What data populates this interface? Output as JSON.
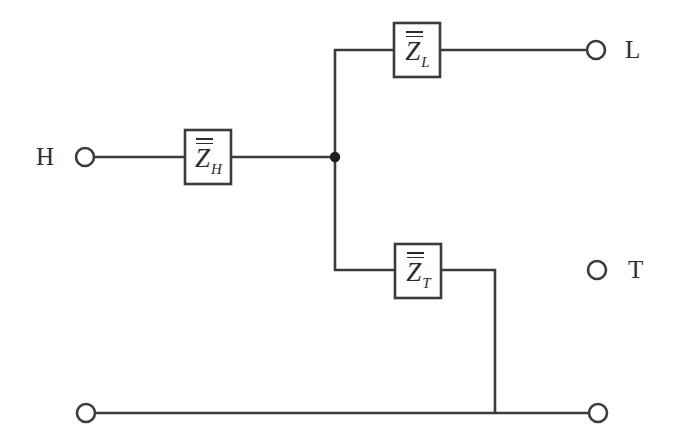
{
  "diagram": {
    "type": "circuit-schematic",
    "background_color": "#ffffff",
    "line_color": "#3b3b3b",
    "text_color": "#2b2b2b"
  },
  "ports": [
    {
      "id": "H",
      "label": "H",
      "label_x": 36,
      "label_y": 144,
      "circle_x": 85,
      "circle_y": 157,
      "radius": 9
    },
    {
      "id": "L",
      "label": "L",
      "label_x": 625,
      "label_y": 37,
      "circle_x": 596,
      "circle_y": 50,
      "radius": 9
    },
    {
      "id": "T",
      "label": "T",
      "label_x": 628,
      "label_y": 257,
      "circle_x": 597,
      "circle_y": 270,
      "radius": 9
    },
    {
      "id": "GND_LEFT",
      "label": "",
      "circle_x": 86,
      "circle_y": 413,
      "radius": 9
    },
    {
      "id": "GND_RIGHT",
      "label": "",
      "circle_x": 598,
      "circle_y": 413,
      "radius": 9
    }
  ],
  "elements": [
    {
      "id": "ZL",
      "symbol": "Z",
      "subscript": "L",
      "overbars": 2,
      "box": {
        "x": 394,
        "y": 23,
        "w": 46,
        "h": 54
      },
      "label_x": 394,
      "label_y": 31
    },
    {
      "id": "ZH",
      "symbol": "Z",
      "subscript": "H",
      "overbars": 2,
      "box": {
        "x": 185,
        "y": 130,
        "w": 46,
        "h": 54
      },
      "label_x": 185,
      "label_y": 138
    },
    {
      "id": "ZT",
      "symbol": "Z",
      "subscript": "T",
      "overbars": 2,
      "box": {
        "x": 395,
        "y": 244,
        "w": 46,
        "h": 54
      },
      "label_x": 395,
      "label_y": 252
    }
  ],
  "junction": {
    "x": 335,
    "y": 157,
    "radius": 5.2
  },
  "wires": [
    {
      "name": "h-port-to-zh",
      "d": "M 95 157 L 185 157"
    },
    {
      "name": "zh-to-junction",
      "d": "M 231 157 L 336 157"
    },
    {
      "name": "junction-up-to-zl-branch",
      "d": "M 335 157 L 335 50 L 394 50"
    },
    {
      "name": "zl-to-l-port",
      "d": "M 440 50 L 587 50"
    },
    {
      "name": "junction-down-to-zt-branch",
      "d": "M 335 157 L 335 270 L 395 270"
    },
    {
      "name": "zt-to-ground-drop",
      "d": "M 441 270 L 495 270 L 495 413"
    },
    {
      "name": "ground-bus",
      "d": "M 95 413 L 589 413"
    }
  ],
  "colors": {
    "stroke": "#3b3b3b",
    "fill": "#ffffff",
    "dot": "#1d1d1d",
    "text": "#2b2b2b"
  }
}
